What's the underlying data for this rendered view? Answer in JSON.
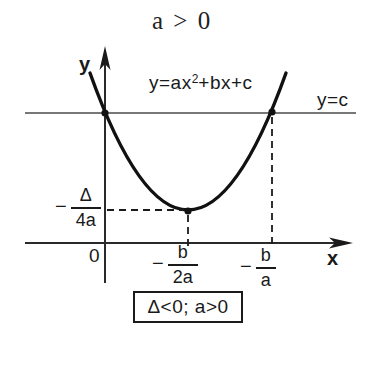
{
  "title": "a > 0",
  "colors": {
    "ink": "#1a1a1a",
    "thin_line": "#4a4a4a",
    "background": "#ffffff"
  },
  "graph": {
    "curve_label": {
      "pre": "y=ax",
      "sup": "2",
      "post": "+bx+c"
    },
    "hline_label": "y=c",
    "y_axis_label": "y",
    "x_axis_label": "x",
    "origin_label": "0",
    "vertex_y_label": {
      "minus": "−",
      "numerator": "Δ",
      "denominator": "4a"
    },
    "vertex_x_label": {
      "minus": "−",
      "numerator": "b",
      "denominator": "2a"
    },
    "root_x_label": {
      "minus": "−",
      "numerator": "b",
      "denominator": "a"
    },
    "condition": "Δ<0; a>0",
    "description": "Upward parabola y=ax^2+bx+c with a>0 and discriminant Δ<0; vertex at x=−b/2a, y=−Δ/4a; horizontal line y=c crosses the curve at x=0 and x=−b/a"
  }
}
